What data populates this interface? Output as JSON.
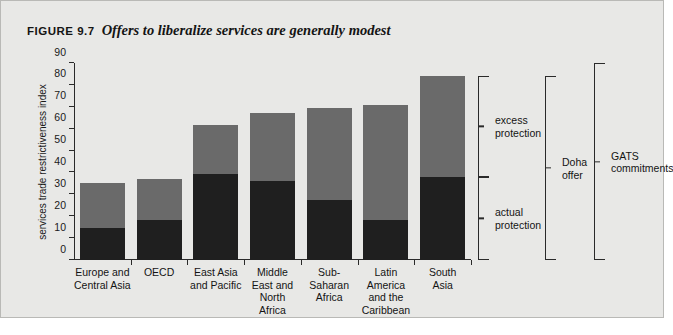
{
  "figure": {
    "number": "FIGURE 9.7",
    "title": "Offers to liberalize services are generally modest"
  },
  "chart_data": {
    "type": "bar",
    "stacked": true,
    "title": "Offers to liberalize services are generally modest",
    "xlabel": "",
    "ylabel": "services trade restrictiveness index",
    "ylim": [
      0,
      90
    ],
    "yticks": [
      0,
      10,
      20,
      30,
      40,
      50,
      60,
      70,
      80,
      90
    ],
    "grid": false,
    "legend_position": "right-brackets",
    "categories": [
      "Europe and\nCentral Asia",
      "OECD",
      "East Asia\nand Pacific",
      "Middle\nEast and\nNorth\nAfrica",
      "Sub-\nSaharan\nAfrica",
      "Latin\nAmerica\nand the\nCaribbean",
      "South\nAsia"
    ],
    "series": [
      {
        "name": "actual protection",
        "color": "#1f1f1f",
        "values": [
          14.5,
          18.5,
          39.5,
          36.0,
          27.5,
          18.5,
          38.0
        ]
      },
      {
        "name": "excess protection",
        "color": "#6a6a6a",
        "values": [
          20.5,
          18.5,
          22.0,
          31.0,
          42.0,
          52.5,
          46.0
        ]
      }
    ],
    "totals": [
      35.0,
      37.0,
      61.5,
      67.0,
      69.5,
      71.0,
      84.0
    ],
    "annotations": [
      {
        "label": "excess\nprotection",
        "spans": [
          38.0,
          84.0
        ]
      },
      {
        "label": "actual\nprotection",
        "spans": [
          0,
          38.0
        ]
      },
      {
        "label": "Doha\noffer",
        "spans": [
          0,
          84.0
        ]
      },
      {
        "label": "GATS\ncommitments",
        "spans": [
          0,
          90.0
        ]
      }
    ]
  }
}
